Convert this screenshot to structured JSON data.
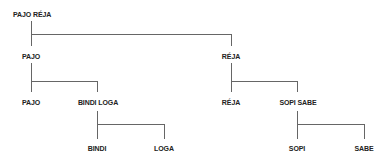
{
  "diagram": {
    "type": "tree",
    "root": {
      "label": "PAJO RÉJA",
      "children": [
        {
          "label": "PAJO",
          "children": [
            {
              "label": "PAJO"
            },
            {
              "label": "BINDI LOGA",
              "children": [
                {
                  "label": "BINDI"
                },
                {
                  "label": "LOGA"
                }
              ]
            }
          ]
        },
        {
          "label": "RÉJA",
          "children": [
            {
              "label": "RÉJA"
            },
            {
              "label": "SOPI SABE",
              "children": [
                {
                  "label": "SOPI"
                },
                {
                  "label": "SABE"
                }
              ]
            }
          ]
        }
      ]
    },
    "nodes": {
      "root": "PAJO RÉJA",
      "l1_left": "PAJO",
      "l1_right": "RÉJA",
      "l2_left_a": "PAJO",
      "l2_left_b": "BINDI LOGA",
      "l2_right_a": "RÉJA",
      "l2_right_b": "SOPI SABE",
      "l3_left_a": "BINDI",
      "l3_left_b": "LOGA",
      "l3_right_a": "SOPI",
      "l3_right_b": "SABE"
    },
    "colors": {
      "line": "#666666",
      "text": "#222222",
      "background": "#ffffff"
    }
  }
}
